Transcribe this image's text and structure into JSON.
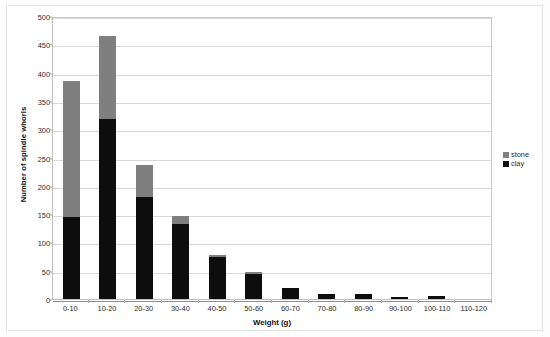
{
  "chart_data": {
    "type": "bar",
    "subtype": "stacked-vertical-bar",
    "title": "",
    "xlabel": "Weight (g)",
    "ylabel": "Number of spindle whorls",
    "categories": [
      "0-10",
      "10-20",
      "20-30",
      "30-40",
      "40-50",
      "50-60",
      "60-70",
      "70-80",
      "80-90",
      "90-100",
      "100-110",
      "110-120"
    ],
    "series": [
      {
        "name": "clay",
        "color": "#0d0d0d",
        "values": [
          145,
          318,
          180,
          132,
          74,
          45,
          20,
          8,
          9,
          4,
          6,
          0
        ]
      },
      {
        "name": "stone",
        "color": "#7f7f7f",
        "values": [
          240,
          147,
          57,
          14,
          4,
          2,
          0,
          0,
          0,
          0,
          0,
          0
        ]
      }
    ],
    "totals": [
      385,
      465,
      237,
      146,
      78,
      47,
      20,
      8,
      9,
      4,
      6,
      0
    ],
    "ylim": [
      0,
      500
    ],
    "yticks": [
      0,
      50,
      100,
      150,
      200,
      250,
      300,
      350,
      400,
      450,
      500
    ],
    "ytick_labels": [
      "0",
      "50",
      "100",
      "150",
      "200",
      "250",
      "300",
      "350",
      "400",
      "450",
      "500"
    ],
    "grid": "horizontal",
    "legend_position": "right",
    "stack_order": [
      "clay",
      "stone"
    ]
  },
  "legend": {
    "entries": [
      {
        "label": "stone",
        "color": "#7f7f7f",
        "swatch": "square-gray-icon"
      },
      {
        "label": "clay",
        "color": "#0d0d0d",
        "swatch": "square-black-icon"
      }
    ]
  },
  "axes": {
    "x_title": "Weight (g)",
    "y_title": "Number of spindle whorls"
  }
}
